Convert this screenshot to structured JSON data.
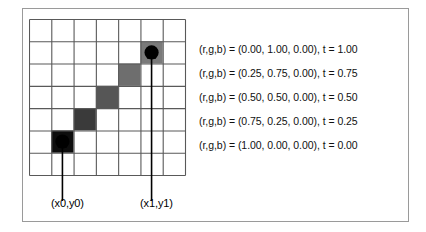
{
  "figure": {
    "grid": {
      "columns": 7,
      "rows": 7,
      "line_color": "#595959",
      "background": "#ffffff"
    },
    "line_cells": [
      {
        "col": 1,
        "row": 5,
        "fill": "#0d0d0d",
        "t": "0.00"
      },
      {
        "col": 2,
        "row": 4,
        "fill": "#3a3a3a",
        "t": "0.25"
      },
      {
        "col": 3,
        "row": 3,
        "fill": "#565656",
        "t": "0.50"
      },
      {
        "col": 4,
        "row": 2,
        "fill": "#6e6e6e",
        "t": "0.75"
      },
      {
        "col": 5,
        "row": 1,
        "fill": "#7a7a7a",
        "t": "1.00"
      }
    ],
    "endpoints": [
      {
        "name": "start-point",
        "col": 1,
        "row": 5,
        "label": "(x0,y0)"
      },
      {
        "name": "end-point",
        "col": 5,
        "row": 1,
        "label": "(x1,y1)"
      }
    ],
    "point_color": "#000000",
    "arrow_color": "#000000"
  },
  "legend": {
    "rows": [
      {
        "text": "(r,g,b) = (0.00, 1.00, 0.00), t = 1.00",
        "r": "0.00",
        "g": "1.00",
        "b": "0.00",
        "t": "1.00"
      },
      {
        "text": "(r,g,b) = (0.25, 0.75, 0.00),  t = 0.75",
        "r": "0.25",
        "g": "0.75",
        "b": "0.00",
        "t": "0.75"
      },
      {
        "text": "(r,g,b) = (0.50, 0.50, 0.00),  t = 0.50",
        "r": "0.50",
        "g": "0.50",
        "b": "0.00",
        "t": "0.50"
      },
      {
        "text": "(r,g,b) = (0.75, 0.25, 0.00),  t = 0.25",
        "r": "0.75",
        "g": "0.25",
        "b": "0.00",
        "t": "0.25"
      },
      {
        "text": "(r,g,b) = (1.00, 0.00, 0.00),  t = 0.00",
        "r": "1.00",
        "g": "0.00",
        "b": "0.00",
        "t": "0.00"
      }
    ]
  },
  "labels": {
    "p0": "(x0,y0)",
    "p1": "(x1,y1)"
  }
}
